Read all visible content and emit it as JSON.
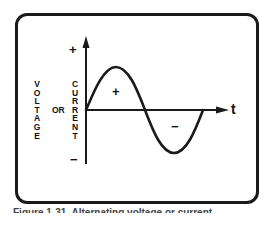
{
  "figure": {
    "type": "sine-wave-diagram",
    "y_axis": {
      "label_left": "VOLTAGE",
      "label_connector": "OR",
      "label_right": "CURRENT",
      "positive_marker": "+",
      "negative_marker": "−"
    },
    "x_axis": {
      "label": "t"
    },
    "regions": {
      "positive_half": "+",
      "negative_half": "−"
    },
    "colors": {
      "line": "#1a1a1a",
      "background": "#ffffff"
    },
    "caption": "Figure 1-31. Alternating voltage or current"
  },
  "chart_data": {
    "type": "line",
    "title": "",
    "xlabel": "t",
    "ylabel": "VOLTAGE OR CURRENT",
    "series": [
      {
        "name": "sine wave (one cycle)",
        "x": [
          0,
          0.25,
          0.5,
          0.75,
          1.0
        ],
        "y": [
          0,
          1,
          0,
          -1,
          0
        ]
      }
    ],
    "annotations": [
      "+ (positive half-cycle)",
      "− (negative half-cycle)"
    ],
    "y_ticks": [
      "+",
      "−"
    ],
    "grid": false,
    "legend": "none"
  }
}
